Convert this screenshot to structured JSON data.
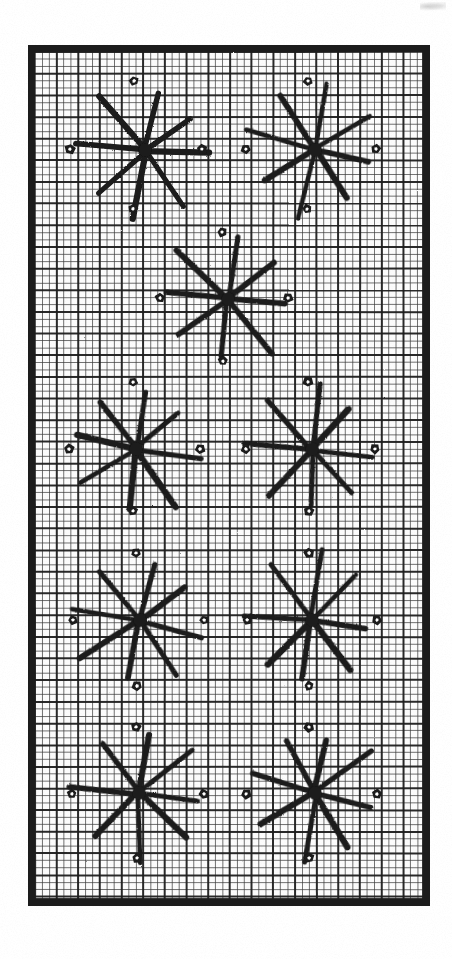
{
  "page": {
    "background_color": "#ffffff",
    "width": 452,
    "height": 959
  },
  "artwork": {
    "description": "Scanned black-and-white grid chart with eight-armed star motifs and small pentagonal dot motifs",
    "ink_color": "#1a1a1a",
    "paper_color": "#fcfcfc",
    "frame": {
      "x": 28,
      "y": 45,
      "width": 402,
      "height": 861,
      "outer_stroke_width": 7,
      "inner_margin": 7
    },
    "grid": {
      "cell_size": 7.22,
      "columns": 52,
      "rows": 112,
      "thin_line_color": "#3a3a3a",
      "thin_line_width": 0.9,
      "major_line_color": "#1f1f1f",
      "major_line_width": 2.0,
      "major_every": 3
    },
    "star_motif": {
      "name": "eight-armed-star",
      "arm_count": 8,
      "arm_length": 62,
      "stroke_width": 5.4,
      "stroke_color": "#1a1a1a",
      "angles_deg": [
        8,
        52,
        98,
        142,
        188,
        232,
        278,
        322
      ],
      "angle_jitter_deg": 6
    },
    "dot_motif": {
      "name": "pentagon-dot",
      "outer_radius": 5.2,
      "inner_radius": 1.9,
      "fill": "#1a1a1a",
      "hole_fill": "#ffffff",
      "offset_from_star": 65
    },
    "stars": [
      {
        "id": "star-r1-c1",
        "cx": 145,
        "cy": 150,
        "rotation": 0
      },
      {
        "id": "star-r1-c2",
        "cx": 315,
        "cy": 150,
        "rotation": 4
      },
      {
        "id": "star-r2-c1",
        "cx": 228,
        "cy": 299,
        "rotation": -3
      },
      {
        "id": "star-r3-c1",
        "cx": 136,
        "cy": 449,
        "rotation": 2
      },
      {
        "id": "star-r3-c2",
        "cx": 312,
        "cy": 449,
        "rotation": -5
      },
      {
        "id": "star-r4-c1",
        "cx": 140,
        "cy": 620,
        "rotation": 3
      },
      {
        "id": "star-r4-c2",
        "cx": 312,
        "cy": 620,
        "rotation": -2
      },
      {
        "id": "star-r5-c1",
        "cx": 139,
        "cy": 793,
        "rotation": -4
      },
      {
        "id": "star-r5-c2",
        "cx": 315,
        "cy": 793,
        "rotation": 5
      }
    ],
    "dots": [
      {
        "id": "dot-1",
        "cx": 134,
        "cy": 81
      },
      {
        "id": "dot-2",
        "cx": 308,
        "cy": 81
      },
      {
        "id": "dot-3",
        "cx": 70,
        "cy": 149
      },
      {
        "id": "dot-4",
        "cx": 202,
        "cy": 149
      },
      {
        "id": "dot-5",
        "cx": 246,
        "cy": 149
      },
      {
        "id": "dot-6",
        "cx": 376,
        "cy": 149
      },
      {
        "id": "dot-7",
        "cx": 133,
        "cy": 209
      },
      {
        "id": "dot-8",
        "cx": 307,
        "cy": 209
      },
      {
        "id": "dot-9",
        "cx": 222,
        "cy": 232
      },
      {
        "id": "dot-10",
        "cx": 160,
        "cy": 298
      },
      {
        "id": "dot-11",
        "cx": 288,
        "cy": 298
      },
      {
        "id": "dot-12",
        "cx": 223,
        "cy": 361
      },
      {
        "id": "dot-13",
        "cx": 133,
        "cy": 382
      },
      {
        "id": "dot-14",
        "cx": 308,
        "cy": 382
      },
      {
        "id": "dot-15",
        "cx": 69,
        "cy": 449
      },
      {
        "id": "dot-16",
        "cx": 200,
        "cy": 449
      },
      {
        "id": "dot-17",
        "cx": 246,
        "cy": 449
      },
      {
        "id": "dot-18",
        "cx": 375,
        "cy": 449
      },
      {
        "id": "dot-19",
        "cx": 133,
        "cy": 511
      },
      {
        "id": "dot-20",
        "cx": 309,
        "cy": 511
      },
      {
        "id": "dot-21",
        "cx": 136,
        "cy": 553
      },
      {
        "id": "dot-22",
        "cx": 309,
        "cy": 553
      },
      {
        "id": "dot-23",
        "cx": 73,
        "cy": 620
      },
      {
        "id": "dot-24",
        "cx": 204,
        "cy": 620
      },
      {
        "id": "dot-25",
        "cx": 247,
        "cy": 620
      },
      {
        "id": "dot-26",
        "cx": 377,
        "cy": 620
      },
      {
        "id": "dot-27",
        "cx": 137,
        "cy": 686
      },
      {
        "id": "dot-28",
        "cx": 309,
        "cy": 686
      },
      {
        "id": "dot-29",
        "cx": 136,
        "cy": 727
      },
      {
        "id": "dot-30",
        "cx": 309,
        "cy": 727
      },
      {
        "id": "dot-31",
        "cx": 72,
        "cy": 794
      },
      {
        "id": "dot-32",
        "cx": 204,
        "cy": 794
      },
      {
        "id": "dot-33",
        "cx": 246,
        "cy": 794
      },
      {
        "id": "dot-34",
        "cx": 377,
        "cy": 794
      },
      {
        "id": "dot-35",
        "cx": 137,
        "cy": 858
      },
      {
        "id": "dot-36",
        "cx": 309,
        "cy": 858
      }
    ]
  }
}
